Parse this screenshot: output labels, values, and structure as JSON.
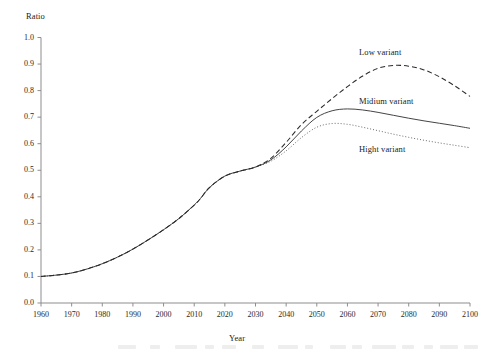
{
  "chart_data": {
    "type": "line",
    "title": "",
    "xlabel": "Year",
    "ylabel": "Ratio",
    "xlim": [
      1960,
      2100
    ],
    "ylim": [
      0.0,
      1.0
    ],
    "grid": false,
    "legend_position": "inline-annotations",
    "x_ticks": [
      "1960",
      "1970",
      "1980",
      "1990",
      "2000",
      "2010",
      "2020",
      "2030",
      "2040",
      "2050",
      "2060",
      "2070",
      "2080",
      "2090",
      "2100"
    ],
    "y_ticks": [
      "0.0",
      "0.1",
      "0.2",
      "0.3",
      "0.4",
      "0.5",
      "0.6",
      "0.7",
      "0.8",
      "0.9",
      "1.0"
    ],
    "x": [
      1960,
      1965,
      1970,
      1975,
      1980,
      1985,
      1990,
      1995,
      2000,
      2005,
      2010,
      2012,
      2015,
      2020,
      2025,
      2030,
      2035,
      2040,
      2045,
      2050,
      2055,
      2060,
      2065,
      2070,
      2075,
      2080,
      2085,
      2090,
      2095,
      2100
    ],
    "series": [
      {
        "name": "Low variant",
        "style": "dashed",
        "color": "#2b2b2b",
        "values": [
          0.1,
          0.105,
          0.113,
          0.128,
          0.148,
          0.173,
          0.203,
          0.238,
          0.276,
          0.318,
          0.369,
          0.393,
          0.435,
          0.478,
          0.497,
          0.512,
          0.545,
          0.605,
          0.672,
          0.722,
          0.77,
          0.815,
          0.855,
          0.884,
          0.895,
          0.892,
          0.878,
          0.852,
          0.818,
          0.778
        ]
      },
      {
        "name": "Midium variant",
        "style": "solid",
        "color": "#3a3a3a",
        "values": [
          0.1,
          0.105,
          0.113,
          0.128,
          0.148,
          0.173,
          0.203,
          0.238,
          0.276,
          0.318,
          0.369,
          0.393,
          0.435,
          0.478,
          0.497,
          0.512,
          0.539,
          0.588,
          0.648,
          0.699,
          0.724,
          0.731,
          0.727,
          0.718,
          0.707,
          0.696,
          0.686,
          0.677,
          0.668,
          0.658
        ]
      },
      {
        "name": "Hight variant",
        "style": "dotted",
        "color": "#6a6a6a",
        "values": [
          0.1,
          0.105,
          0.113,
          0.128,
          0.148,
          0.173,
          0.203,
          0.238,
          0.276,
          0.318,
          0.369,
          0.393,
          0.435,
          0.478,
          0.497,
          0.512,
          0.534,
          0.573,
          0.623,
          0.662,
          0.676,
          0.673,
          0.662,
          0.649,
          0.636,
          0.624,
          0.613,
          0.603,
          0.594,
          0.585
        ]
      }
    ],
    "annotations": [
      {
        "text": "Low variant",
        "x": 2072,
        "y": 0.945
      },
      {
        "text": "Midium variant",
        "x": 2072,
        "y": 0.76
      },
      {
        "text": "Hight variant",
        "x": 2072,
        "y": 0.575
      }
    ]
  },
  "axes": {
    "y_axis_title": "Ratio",
    "x_axis_title": "Year"
  }
}
